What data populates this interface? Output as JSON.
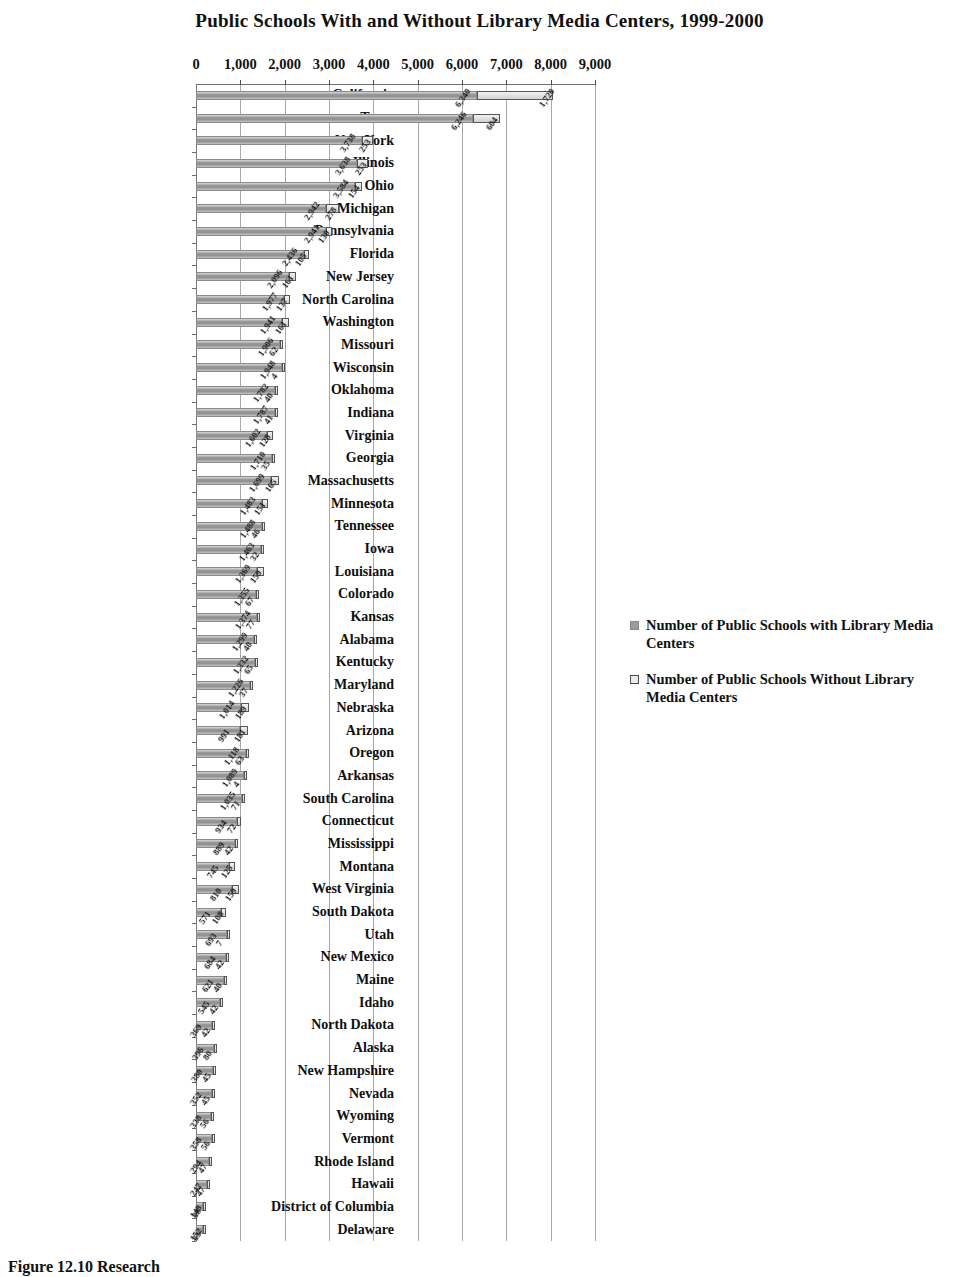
{
  "chart_data": {
    "type": "bar",
    "orientation": "horizontal",
    "stacked": true,
    "title": "Public Schools With and Without Library Media Centers, 1999-2000",
    "xlabel": "",
    "ylabel": "",
    "xlim": [
      0,
      9000
    ],
    "xticks": [
      0,
      1000,
      2000,
      3000,
      4000,
      5000,
      6000,
      7000,
      8000,
      9000
    ],
    "xtick_labels": [
      "0",
      "1,000",
      "2,000",
      "3,000",
      "4,000",
      "5,000",
      "6,000",
      "7,000",
      "8,000",
      "9,000"
    ],
    "grid": true,
    "legend_position": "right",
    "categories": [
      "California",
      "Texas",
      "New York",
      "Illinois",
      "Ohio",
      "Michigan",
      "Pennsylvania",
      "Florida",
      "New Jersey",
      "North Carolina",
      "Washington",
      "Missouri",
      "Wisconsin",
      "Oklahoma",
      "Indiana",
      "Virginia",
      "Georgia",
      "Massachusetts",
      "Minnesota",
      "Tennessee",
      "Iowa",
      "Louisiana",
      "Colorado",
      "Kansas",
      "Alabama",
      "Kentucky",
      "Maryland",
      "Nebraska",
      "Arizona",
      "Oregon",
      "Arkansas",
      "South Carolina",
      "Connecticut",
      "Mississippi",
      "Montana",
      "West Virginia",
      "South Dakota",
      "Utah",
      "New Mexico",
      "Maine",
      "Idaho",
      "North Dakota",
      "Alaska",
      "New Hampshire",
      "Nevada",
      "Wyoming",
      "Vermont",
      "Rhode Island",
      "Hawaii",
      "District of Columbia",
      "Delaware"
    ],
    "series": [
      {
        "name": "Number of Public Schools with Library Media Centers",
        "values": [
          6340,
          6246,
          3738,
          3638,
          3584,
          2942,
          2941,
          2436,
          2096,
          1977,
          1941,
          1906,
          1948,
          1782,
          1787,
          1602,
          1710,
          1699,
          1483,
          1488,
          1463,
          1369,
          1355,
          1374,
          1299,
          1332,
          1226,
          1014,
          991,
          1118,
          1089,
          1035,
          934,
          889,
          745,
          810,
          571,
          693,
          684,
          621,
          545,
          369,
          396,
          380,
          352,
          338,
          358,
          294,
          247,
          148,
          152
        ],
        "labels": [
          "6,340",
          "6,246",
          "3,738",
          "3,638",
          "3,584",
          "2,942",
          "2,941",
          "2,436",
          "2,096",
          "1,977",
          "1,941",
          "1,906",
          "1,948",
          "1,782",
          "1,787",
          "1,602",
          "1,710",
          "1,699",
          "1,483",
          "1,488",
          "1,463",
          "1,369",
          "1,355",
          "1,374",
          "1,299",
          "1,332",
          "1,226",
          "1,014",
          "991",
          "1,118",
          "1,089",
          "1,035",
          "934",
          "889",
          "745",
          "810",
          "571",
          "693",
          "684",
          "621",
          "545",
          "369",
          "396",
          "380",
          "352",
          "338",
          "358",
          "294",
          "247",
          "148",
          "152"
        ]
      },
      {
        "name": "Number of Public Schools Without Library Media Centers",
        "values": [
          1720,
          604,
          253,
          253,
          154,
          278,
          130,
          105,
          161,
          137,
          161,
          62,
          4,
          40,
          41,
          128,
          35,
          165,
          151,
          46,
          32,
          159,
          67,
          77,
          40,
          65,
          37,
          189,
          181,
          63,
          4,
          71,
          72,
          42,
          125,
          159,
          108,
          7,
          42,
          40,
          42,
          42,
          80,
          45,
          45,
          56,
          56,
          47,
          47,
          38,
          33
        ],
        "labels": [
          "1,720",
          "604",
          "253",
          "253",
          "154",
          "278",
          "130",
          "105",
          "161",
          "137",
          "161",
          "62",
          "4",
          "40",
          "41",
          "128",
          "35",
          "165",
          "151",
          "46",
          "32",
          "159",
          "67",
          "77",
          "40",
          "65",
          "37",
          "189",
          "181",
          "63",
          "4",
          "71",
          "72",
          "42",
          "125",
          "159",
          "108",
          "7",
          "42",
          "40",
          "42",
          "42",
          "80",
          "45",
          "45",
          "56",
          "56",
          "47",
          "47",
          "38",
          "33"
        ]
      }
    ],
    "colors": {
      "series_with": "#9b9b9b",
      "series_without": "#ececec",
      "gridline": "#a8a8a8",
      "text": "#111111",
      "background": "#ffffff"
    }
  },
  "legend": {
    "items": [
      {
        "label": "Number of Public Schools with Library Media Centers",
        "swatch": "with"
      },
      {
        "label": "Number of Public Schools Without Library Media Centers",
        "swatch": "without"
      }
    ]
  },
  "caption": {
    "text": "Figure 12.10   Research"
  }
}
